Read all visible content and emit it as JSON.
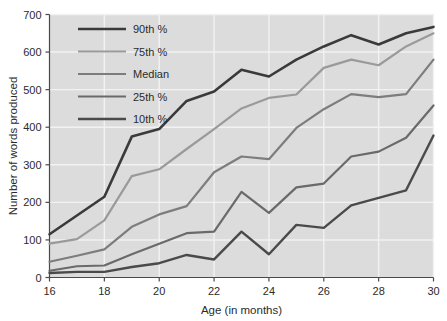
{
  "chart_data": {
    "type": "line",
    "title": "",
    "xlabel": "Age (in months)",
    "ylabel": "Number of words produced",
    "xlim": [
      16,
      30
    ],
    "ylim": [
      0,
      700
    ],
    "grid": true,
    "legend_position": "upper-left-inside",
    "x": [
      16,
      17,
      18,
      19,
      20,
      21,
      22,
      23,
      24,
      25,
      26,
      27,
      28,
      29,
      30
    ],
    "xtick_labels": [
      "16",
      "18",
      "20",
      "22",
      "24",
      "26",
      "28",
      "30"
    ],
    "xticks": [
      16,
      18,
      20,
      22,
      24,
      26,
      28,
      30
    ],
    "ytick_labels": [
      "0",
      "100",
      "200",
      "300",
      "400",
      "500",
      "600",
      "700"
    ],
    "yticks": [
      0,
      100,
      200,
      300,
      400,
      500,
      600,
      700
    ],
    "series": [
      {
        "name": "90th %",
        "color": "#3a3a3a",
        "width": 2.6,
        "values": [
          115,
          165,
          215,
          375,
          395,
          470,
          495,
          553,
          535,
          580,
          615,
          645,
          620,
          650,
          667
        ]
      },
      {
        "name": "75th %",
        "color": "#9a9a9a",
        "width": 2.2,
        "values": [
          90,
          102,
          152,
          270,
          288,
          342,
          395,
          450,
          478,
          487,
          558,
          580,
          565,
          615,
          650
        ]
      },
      {
        "name": "Median",
        "color": "#7d7d7d",
        "width": 2.2,
        "values": [
          42,
          58,
          75,
          135,
          168,
          190,
          280,
          322,
          315,
          398,
          448,
          488,
          480,
          488,
          580
        ]
      },
      {
        "name": "25th %",
        "color": "#6a6a6a",
        "width": 2.2,
        "values": [
          18,
          30,
          32,
          62,
          90,
          118,
          122,
          228,
          172,
          240,
          250,
          322,
          335,
          372,
          458
        ]
      },
      {
        "name": "10th %",
        "color": "#4a4a4a",
        "width": 2.4,
        "values": [
          12,
          15,
          15,
          28,
          38,
          60,
          48,
          122,
          62,
          140,
          132,
          192,
          212,
          232,
          378
        ]
      }
    ]
  },
  "legend": {
    "items": [
      {
        "label": "90th %"
      },
      {
        "label": "75th %"
      },
      {
        "label": "Median"
      },
      {
        "label": "25th %"
      },
      {
        "label": "10th %"
      }
    ]
  },
  "style": {
    "plot_background": "#dcdcdc",
    "page_background": "#ffffff",
    "gridline_color": "#f2f2f2",
    "axis_color": "#4a4a4a",
    "text_color": "#2b2b2b"
  }
}
